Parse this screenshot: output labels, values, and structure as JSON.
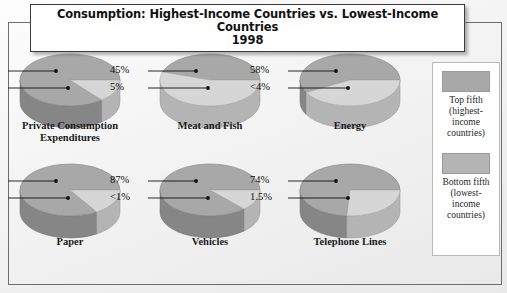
{
  "title": {
    "line1": "Consumption: Highest-Income Countries vs. Lowest-Income Countries",
    "line2": "1998"
  },
  "legend": {
    "top": {
      "swatch_color": "#a8a8a8",
      "line1": "Top fifth",
      "line2": "(highest-",
      "line3": "income",
      "line4": "countries)"
    },
    "bottom": {
      "swatch_color": "#b4b4b4",
      "line1": "Bottom fifth",
      "line2": "(lowest-",
      "line3": "income",
      "line4": "countries)"
    }
  },
  "chart_data": {
    "type": "pie",
    "title": "Consumption: Highest-Income Countries vs. Lowest-Income Countries",
    "subtitle": "1998",
    "series": [
      {
        "name": "Top fifth (highest-income countries)",
        "color": "#a8a8a8"
      },
      {
        "name": "Bottom fifth (lowest-income countries)",
        "color": "#d6d6d6"
      }
    ],
    "categories": [
      "Private Consumption Expenditures",
      "Meat and Fish",
      "Energy",
      "Paper",
      "Vehicles",
      "Telephone Lines"
    ],
    "units": "percent of world total",
    "pies": [
      {
        "label_line1": "Private Consumption",
        "label_line2": "Expenditures",
        "top_fifth": 86,
        "bottom_fifth": 1.3,
        "top_label": "86%",
        "bottom_label": "1.3%"
      },
      {
        "label_line1": "Meat and Fish",
        "label_line2": "",
        "top_fifth": 45,
        "bottom_fifth": 5,
        "top_label": "45%",
        "bottom_label": "5%"
      },
      {
        "label_line1": "Energy",
        "label_line2": "",
        "top_fifth": 58,
        "bottom_fifth": 4,
        "top_label": "58%",
        "bottom_label": "<4%"
      },
      {
        "label_line1": "Paper",
        "label_line2": "",
        "top_fifth": 84,
        "bottom_fifth": 1.1,
        "top_label": "84%",
        "bottom_label": "1.1%"
      },
      {
        "label_line1": "Vehicles",
        "label_line2": "",
        "top_fifth": 87,
        "bottom_fifth": 1,
        "top_label": "87%",
        "bottom_label": "<1%"
      },
      {
        "label_line1": "Telephone Lines",
        "label_line2": "",
        "top_fifth": 74,
        "bottom_fifth": 1.5,
        "top_label": "74%",
        "bottom_label": "1.5%"
      }
    ]
  }
}
